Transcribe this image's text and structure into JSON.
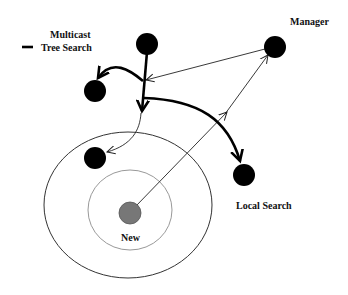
{
  "diagram": {
    "legend": {
      "title": "Multicast",
      "entry_label": "Tree Search",
      "entry_symbol": "thick-line"
    },
    "nodes": [
      {
        "id": "root",
        "label": "",
        "color": "#000000"
      },
      {
        "id": "upper-left",
        "label": "",
        "color": "#000000"
      },
      {
        "id": "lower-left",
        "label": "",
        "color": "#000000"
      },
      {
        "id": "manager",
        "label": "Manager",
        "color": "#000000"
      },
      {
        "id": "local-search",
        "label": "Local Search",
        "color": "#000000"
      },
      {
        "id": "new",
        "label": "New",
        "color": "#777777"
      }
    ],
    "regions": [
      {
        "id": "outer-ring",
        "stroke": "#333333"
      },
      {
        "id": "inner-ring",
        "stroke": "#999999"
      }
    ],
    "edges": [
      {
        "from": "root",
        "to": "upper-left",
        "style": "thick",
        "kind": "tree-search"
      },
      {
        "from": "root",
        "to": "branch-point",
        "style": "thick",
        "kind": "tree-search"
      },
      {
        "from": "branch-point",
        "to": "local-search",
        "style": "thick",
        "kind": "tree-search"
      },
      {
        "from": "branch-point",
        "to": "lower-left",
        "style": "thin",
        "kind": "multicast"
      },
      {
        "from": "new",
        "to": "manager",
        "style": "thin",
        "kind": "request"
      },
      {
        "from": "manager",
        "to": "root",
        "style": "thin",
        "kind": "reply"
      }
    ]
  }
}
